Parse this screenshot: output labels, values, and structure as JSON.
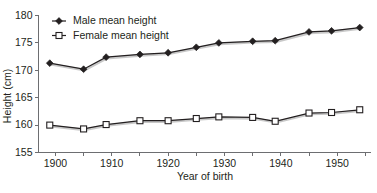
{
  "chart_data": {
    "type": "line",
    "title": "",
    "xlabel": "Year of birth",
    "ylabel": "Height (cm)",
    "xlim": [
      1897,
      1956
    ],
    "ylim": [
      155,
      180
    ],
    "grid": false,
    "legend_position": "top-left",
    "x_ticks": [
      1900,
      1910,
      1920,
      1930,
      1940,
      1950
    ],
    "x_minor_ticks": [
      1900,
      1905,
      1910,
      1915,
      1920,
      1925,
      1930,
      1935,
      1940,
      1945,
      1950,
      1955
    ],
    "y_ticks": [
      155,
      160,
      165,
      170,
      175,
      180
    ],
    "x": [
      1899,
      1905,
      1909,
      1915,
      1920,
      1925,
      1929,
      1935,
      1939,
      1945,
      1949,
      1954
    ],
    "series": [
      {
        "name": "Male mean height",
        "marker": "filled-diamond",
        "values": [
          171.3,
          170.2,
          172.4,
          172.9,
          173.2,
          174.2,
          175.0,
          175.3,
          175.4,
          177.0,
          177.2,
          177.8
        ]
      },
      {
        "name": "Female mean height",
        "marker": "open-square",
        "values": [
          160.0,
          159.3,
          160.1,
          160.8,
          160.8,
          161.2,
          161.5,
          161.4,
          160.7,
          162.2,
          162.3,
          162.8
        ]
      }
    ]
  },
  "legend": {
    "entries": [
      {
        "label": "Male mean height",
        "marker": "filled-diamond"
      },
      {
        "label": "Female mean height",
        "marker": "open-square"
      }
    ]
  },
  "axes": {
    "y_title": "Height (cm)",
    "x_title": "Year of birth",
    "y_tick_labels": [
      "155",
      "160",
      "165",
      "170",
      "175",
      "180"
    ],
    "x_tick_labels": [
      "1900",
      "1910",
      "1920",
      "1930",
      "1940",
      "1950"
    ]
  },
  "colors": {
    "ink": "#231f20",
    "axis": "#6d6e71",
    "shadow": "#9a9a9a",
    "background": "#ffffff"
  }
}
